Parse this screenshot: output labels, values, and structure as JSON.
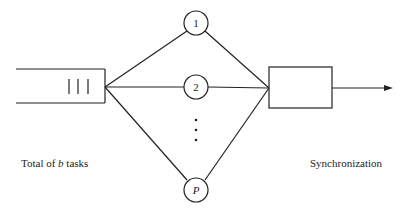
{
  "diagram": {
    "queue": {
      "label": "Total of b tasks",
      "label_prefix": "Total of ",
      "label_var": "b",
      "label_suffix": " tasks"
    },
    "servers": [
      {
        "label": "1"
      },
      {
        "label": "2"
      },
      {
        "label": "P"
      }
    ],
    "ellipsis": "⋮",
    "sync": {
      "label": "Synchronization"
    },
    "colors": {
      "stroke": "#222222",
      "background": "#ffffff"
    }
  }
}
